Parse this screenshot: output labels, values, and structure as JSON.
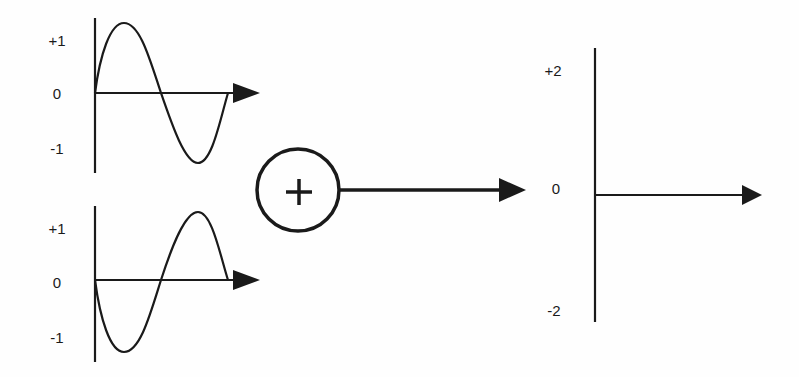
{
  "diagram": {
    "title": "",
    "input_top": {
      "labels": {
        "pos": "+1",
        "zero": "0",
        "neg": "-1"
      },
      "wave": "sine"
    },
    "input_bottom": {
      "labels": {
        "pos": "+1",
        "zero": "0",
        "neg": "-1"
      },
      "wave": "inverted-sine"
    },
    "summing_junction": {
      "symbol": "+",
      "icon": "plus-icon"
    },
    "output": {
      "labels": {
        "pos": "+2",
        "zero": "0",
        "neg": "-2"
      },
      "wave": "flat-zero"
    },
    "colors": {
      "stroke": "#1a1a1a",
      "background": "#fefefe"
    }
  }
}
